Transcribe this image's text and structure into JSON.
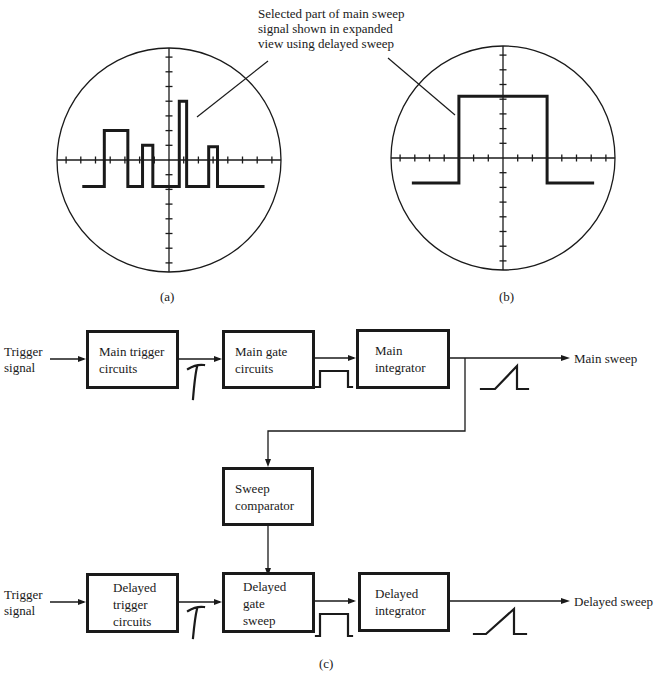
{
  "figure": {
    "annotation": {
      "lines": [
        "Selected part of main sweep",
        "signal shown in expanded",
        "view using delayed sweep"
      ]
    },
    "captions": {
      "a": "(a)",
      "b": "(b)",
      "c": "(c)"
    },
    "scope_a": {
      "description": "Main sweep display showing pulse train",
      "pulses": [
        {
          "start": -4.4,
          "end": -2.8,
          "level": 2.0
        },
        {
          "start": -1.8,
          "end": -1.1,
          "level": 1.0
        },
        {
          "start": 0.7,
          "end": 1.2,
          "level": 4.0
        },
        {
          "start": 2.7,
          "end": 3.3,
          "level": 0.9
        }
      ],
      "baseline": -1.8,
      "trace_range": [
        -5.9,
        6.5
      ]
    },
    "scope_b": {
      "description": "Expanded view of selected pulse using delayed sweep",
      "pulses": [
        {
          "start": -3.0,
          "end": 3.0,
          "level": 4.2
        }
      ],
      "baseline": -1.7,
      "trace_range": [
        -6.2,
        6.2
      ]
    },
    "block_diagram": {
      "inputs": {
        "main_trigger": [
          "Trigger",
          "signal"
        ],
        "delayed_trigger": [
          "Trigger",
          "signal"
        ]
      },
      "outputs": {
        "main": "Main sweep",
        "delayed": "Delayed sweep"
      },
      "blocks": {
        "main_trigger": [
          "Main trigger",
          "circuits"
        ],
        "main_gate": [
          "Main gate",
          "circuits"
        ],
        "main_integrator": [
          "Main",
          "integrator"
        ],
        "sweep_comparator": [
          "Sweep",
          "comparator"
        ],
        "delayed_trigger": [
          "Delayed",
          "trigger",
          "circuits"
        ],
        "delayed_gate": [
          "Delayed",
          "gate",
          "sweep"
        ],
        "delayed_integrator": [
          "Delayed",
          "integrator"
        ]
      }
    }
  }
}
